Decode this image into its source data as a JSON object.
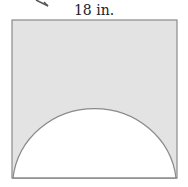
{
  "diagram": {
    "top_label": "18 in.",
    "shapes": {
      "square": {
        "side_label": "18 in.",
        "fill": "#e3e3e3",
        "stroke": "#8a8a8a"
      },
      "semicircle": {
        "fill": "#ffffff",
        "stroke": "#8a8a8a",
        "diameter": "full width of square"
      }
    },
    "arrow_fragment": "partial arrow at top-left"
  }
}
